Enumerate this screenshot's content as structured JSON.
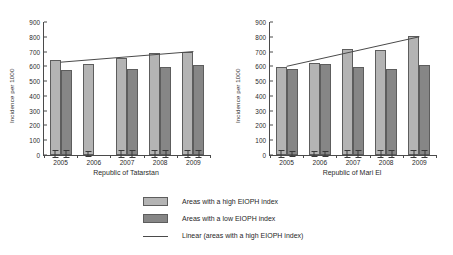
{
  "chart_data": [
    {
      "type": "bar",
      "title": "",
      "xlabel": "Republic of Tatarstan",
      "ylabel": "Incidence per 1000",
      "categories": [
        "2005",
        "2006",
        "2007",
        "2008",
        "2009"
      ],
      "ylim": [
        0,
        900
      ],
      "yticks": [
        0,
        100,
        200,
        300,
        400,
        500,
        600,
        700,
        800,
        900
      ],
      "grid": false,
      "series": [
        {
          "name": "Areas with a high EIOPH index",
          "color": "#b4b4b4",
          "values": [
            645,
            618,
            655,
            688,
            700
          ],
          "err_low": [
            27,
            22,
            25,
            25,
            27
          ],
          "err_high": [
            27,
            22,
            25,
            25,
            27
          ]
        },
        {
          "name": "Areas with a low EIOPH index",
          "color": "#868686",
          "values": [
            572,
            null,
            583,
            595,
            608
          ],
          "err_low": [
            25,
            null,
            25,
            28,
            25
          ],
          "err_high": [
            25,
            null,
            25,
            28,
            25
          ]
        }
      ],
      "trendline": {
        "name": "Linear (areas with a high EIOPH index)",
        "color": "#4a4a4a",
        "start_value": 628,
        "end_value": 700
      }
    },
    {
      "type": "bar",
      "title": "",
      "xlabel": "Republic of Mari El",
      "ylabel": "Incidence per 1000",
      "categories": [
        "2005",
        "2006",
        "2007",
        "2008",
        "2009"
      ],
      "ylim": [
        0,
        900
      ],
      "yticks": [
        0,
        100,
        200,
        300,
        400,
        500,
        600,
        700,
        800,
        900
      ],
      "grid": false,
      "series": [
        {
          "name": "Areas with a high EIOPH index",
          "color": "#b4b4b4",
          "values": [
            595,
            625,
            718,
            713,
            805
          ],
          "err_low": [
            25,
            22,
            28,
            30,
            28
          ],
          "err_high": [
            25,
            22,
            28,
            30,
            28
          ]
        },
        {
          "name": "Areas with a low EIOPH index",
          "color": "#868686",
          "values": [
            585,
            618,
            598,
            583,
            612
          ],
          "err_low": [
            18,
            22,
            25,
            25,
            25
          ],
          "err_high": [
            18,
            22,
            25,
            25,
            25
          ]
        }
      ],
      "trendline": {
        "name": "Linear (areas with a high EIOPH index)",
        "color": "#4a4a4a",
        "start_value": 600,
        "end_value": 800
      }
    }
  ],
  "legend": {
    "position": "bottom-center",
    "items": [
      {
        "label": "Areas with a high EIOPH index",
        "marker": "swatch-high"
      },
      {
        "label": "Areas with a low EIOPH index",
        "marker": "swatch-low"
      },
      {
        "label": "Linear (areas with a high EIOPH index)",
        "marker": "line"
      }
    ]
  }
}
